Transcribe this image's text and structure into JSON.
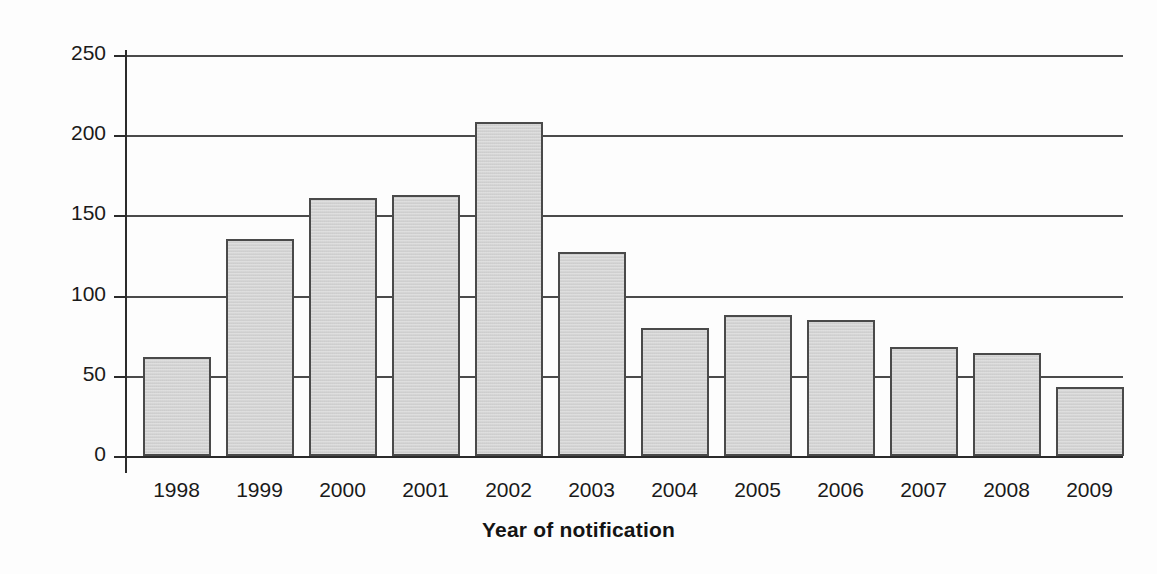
{
  "chart_data": {
    "type": "bar",
    "title": "",
    "xlabel": "Year of notification",
    "ylabel": "No. of notified cases",
    "categories": [
      "1998",
      "1999",
      "2000",
      "2001",
      "2002",
      "2003",
      "2004",
      "2005",
      "2006",
      "2007",
      "2008",
      "2009"
    ],
    "values": [
      62,
      135,
      161,
      163,
      208,
      127,
      80,
      88,
      85,
      68,
      64,
      43
    ],
    "ylim": [
      0,
      250
    ],
    "ytick_labels": [
      "0",
      "50",
      "100",
      "150",
      "200",
      "250"
    ],
    "ytick_values": [
      0,
      50,
      100,
      150,
      200,
      250
    ],
    "grid": "horizontal",
    "legend": "none",
    "bar_fill_color": "#d4d4d4",
    "bar_edge_color": "#4a4a4a",
    "axis_color": "#2b2b2b",
    "background_color": "#ffffff"
  }
}
